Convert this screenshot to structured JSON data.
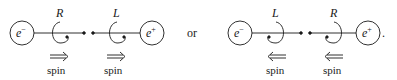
{
  "diagram": {
    "left": {
      "particle_left": {
        "symbol": "e",
        "charge": "−"
      },
      "particle_right": {
        "symbol": "e",
        "charge": "+"
      },
      "helicity_left": "R",
      "helicity_right": "L",
      "spin_left": {
        "direction": "right",
        "label": "spin"
      },
      "spin_right": {
        "direction": "right",
        "label": "spin"
      }
    },
    "separator": "or",
    "right": {
      "particle_left": {
        "symbol": "e",
        "charge": "−"
      },
      "particle_right": {
        "symbol": "e",
        "charge": "+"
      },
      "helicity_left": "L",
      "helicity_right": "R",
      "spin_left": {
        "direction": "left",
        "label": "spin"
      },
      "spin_right": {
        "direction": "left",
        "label": "spin"
      },
      "trailing": "."
    },
    "colors": {
      "ink": "#1a1a1a",
      "background": "#ffffff"
    }
  }
}
